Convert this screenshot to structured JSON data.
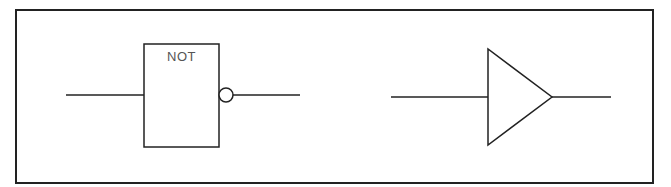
{
  "diagram": {
    "frame": {
      "x": 16,
      "y": 10,
      "width": 637,
      "height": 173,
      "stroke": "#222222"
    },
    "line_color": "#222222",
    "not_gate": {
      "label": "NOT",
      "box": {
        "x": 144,
        "y": 44,
        "width": 75,
        "height": 103
      },
      "input_line": {
        "x1": 66,
        "y1": 95,
        "x2": 144,
        "y2": 95
      },
      "bubble": {
        "cx": 226,
        "cy": 95,
        "r": 7
      },
      "output_line": {
        "x1": 233,
        "y1": 95,
        "x2": 300,
        "y2": 95
      }
    },
    "buffer_gate": {
      "triangle_points": "488,49 488,145 552,97",
      "input_line": {
        "x1": 391,
        "y1": 97,
        "x2": 488,
        "y2": 97
      },
      "output_line": {
        "x1": 552,
        "y1": 97,
        "x2": 611,
        "y2": 97
      }
    }
  }
}
